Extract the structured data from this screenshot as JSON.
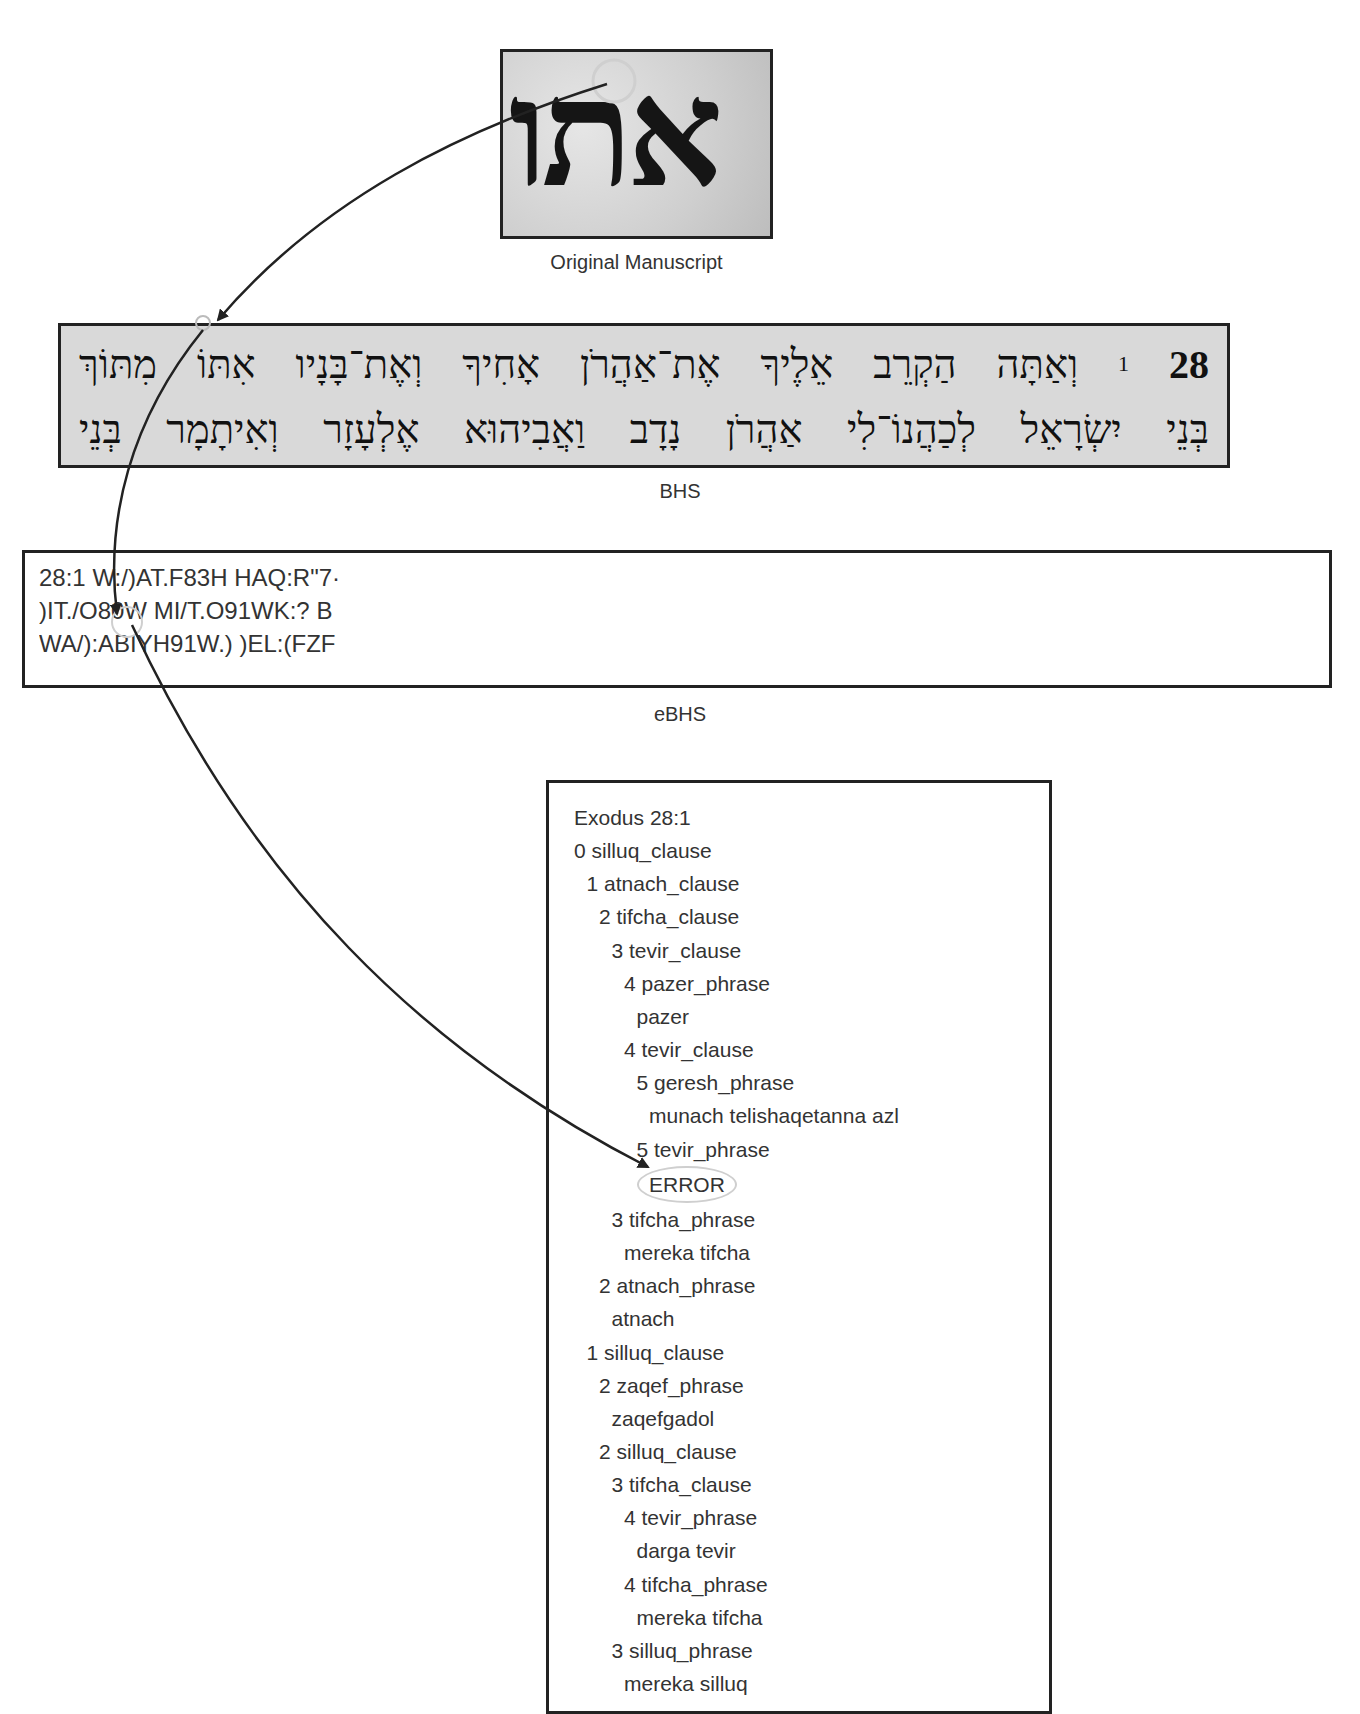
{
  "figure": {
    "panels": {
      "manuscript": {
        "caption": "Original Manuscript",
        "glyph_text": "אתו"
      },
      "bhs": {
        "caption": "BHS",
        "chapter": "28",
        "verse": "1",
        "line1": "וְאַתָּה הַקְרֵב אֵלֶיךָ אֶת־אַהֲרֹן אָחִיךָ וְאֶת־בָּנָיו אִתּוֹ מִתּוֹךְ",
        "line2": "בְּנֵי יִשְׂרָאֵל לְכַהֲנוֹ־לִי אַהֲרֹן נָדָב וַאֲבִיהוּא אֶלְעָזָר וְאִיתָמָר בְּנֵי"
      },
      "ebhs": {
        "caption": "eBHS",
        "lines": [
          "28:1 W:/)AT.F83H HAQ:R\"7·",
          ")IT./O80W MI/T.O91WK:? B",
          "WA/):ABIYH91W.) )EL:(FZF"
        ]
      },
      "parse_tree": {
        "title": "Exodus 28:1",
        "lines": [
          {
            "indent": 0,
            "text": "0 silluq_clause"
          },
          {
            "indent": 1,
            "text": "1 atnach_clause"
          },
          {
            "indent": 2,
            "text": "2 tifcha_clause"
          },
          {
            "indent": 3,
            "text": "3 tevir_clause"
          },
          {
            "indent": 4,
            "text": "4 pazer_phrase"
          },
          {
            "indent": 5,
            "text": "pazer"
          },
          {
            "indent": 4,
            "text": "4 tevir_clause"
          },
          {
            "indent": 5,
            "text": "5 geresh_phrase"
          },
          {
            "indent": 6,
            "text": "munach telishaqetanna azl"
          },
          {
            "indent": 5,
            "text": "5 tevir_phrase"
          },
          {
            "indent": 6,
            "text": "ERROR",
            "highlight": true
          },
          {
            "indent": 3,
            "text": "3 tifcha_phrase"
          },
          {
            "indent": 4,
            "text": "mereka tifcha"
          },
          {
            "indent": 2,
            "text": "2 atnach_phrase"
          },
          {
            "indent": 3,
            "text": "atnach"
          },
          {
            "indent": 1,
            "text": "1 silluq_clause"
          },
          {
            "indent": 2,
            "text": "2 zaqef_phrase"
          },
          {
            "indent": 3,
            "text": "zaqefgadol"
          },
          {
            "indent": 2,
            "text": "2 silluq_clause"
          },
          {
            "indent": 3,
            "text": "3 tifcha_clause"
          },
          {
            "indent": 4,
            "text": "4 tevir_phrase"
          },
          {
            "indent": 5,
            "text": "darga tevir"
          },
          {
            "indent": 4,
            "text": "4 tifcha_phrase"
          },
          {
            "indent": 5,
            "text": "mereka tifcha"
          },
          {
            "indent": 3,
            "text": "3 silluq_phrase"
          },
          {
            "indent": 4,
            "text": "mereka silluq"
          }
        ]
      }
    },
    "colors": {
      "border": "#222222",
      "text": "#333333",
      "highlight_circle": "#cfcfcf",
      "bhs_background": "#d9d9d9"
    }
  }
}
